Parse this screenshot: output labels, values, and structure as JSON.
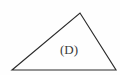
{
  "figure": {
    "name": "triangle-figure",
    "kind": "geometry-diagram",
    "background_color": "#fefefe",
    "stroke_color": "#2b2b2b",
    "label_color": "#3a3a3a",
    "interior_label": "(D)",
    "shape": {
      "type": "triangle",
      "points": "12,70 80,13 116,70",
      "vertices": [
        {
          "name": "left-vertex",
          "x": 12,
          "y": 70
        },
        {
          "name": "apex-vertex",
          "x": 80,
          "y": 13
        },
        {
          "name": "right-vertex",
          "x": 116,
          "y": 70
        }
      ]
    }
  }
}
